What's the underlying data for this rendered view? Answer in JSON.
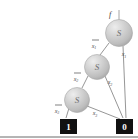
{
  "figure": {
    "background_color": "#ffffff",
    "baseline_color": "#6b6b6b"
  },
  "root": {
    "label": "f",
    "stem_label_name": "function-output-label"
  },
  "nodes": [
    {
      "id": "n1",
      "letter": "S",
      "cx": 119,
      "cy": 33,
      "r": 13.5,
      "fill": "#c9c9c9",
      "level": 1
    },
    {
      "id": "n2",
      "letter": "S",
      "cx": 97,
      "cy": 67,
      "r": 12.5,
      "fill": "#c9c9c9",
      "level": 2
    },
    {
      "id": "n3",
      "letter": "S",
      "cx": 77,
      "cy": 100,
      "r": 12.5,
      "fill": "#c9c9c9",
      "level": 3
    }
  ],
  "terminals": [
    {
      "id": "t1",
      "value": "1",
      "x": 60,
      "y": 119,
      "w": 17,
      "h": 15,
      "fill": "#111111",
      "text_color": "#ffffff"
    },
    {
      "id": "t0",
      "value": "0",
      "x": 116,
      "y": 119,
      "w": 17,
      "h": 15,
      "fill": "#111111",
      "text_color": "#ffffff"
    }
  ],
  "edges": [
    {
      "from": "n1",
      "to": "n2",
      "label": "x",
      "subscript": "1",
      "negated": true,
      "label_x": 96,
      "label_y": 45
    },
    {
      "from": "n1",
      "to": "t0",
      "label": "x",
      "subscript": "1",
      "negated": false,
      "label_x": 125,
      "label_y": 54
    },
    {
      "from": "n2",
      "to": "n3",
      "label": "x",
      "subscript": "2",
      "negated": true,
      "label_x": 78,
      "label_y": 78
    },
    {
      "from": "n2",
      "to": "t0",
      "label": "x",
      "subscript": "2",
      "negated": false,
      "label_x": 111,
      "label_y": 82
    },
    {
      "from": "n3",
      "to": "t1",
      "label": "x",
      "subscript": "3",
      "negated": true,
      "label_x": 59,
      "label_y": 110
    },
    {
      "from": "n3",
      "to": "t0",
      "label": "x",
      "subscript": "3",
      "negated": false,
      "label_x": 96,
      "label_y": 113
    }
  ],
  "colors": {
    "node_fill": "#c9c9c9",
    "node_highlight": "#eaeaea",
    "node_shadow": "#9b9b9b",
    "edge_stroke": "#8a8a8a",
    "terminal_fill": "#111111",
    "terminal_text": "#ffffff"
  }
}
